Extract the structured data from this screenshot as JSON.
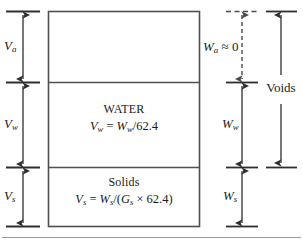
{
  "diagram": {
    "colors": {
      "stroke": "#3a3a3a",
      "text": "#1a1a1a",
      "background": "#ffffff",
      "baseline": "#8a8a8a"
    },
    "volume_side": {
      "items": [
        {
          "id": "air",
          "symbol": "V",
          "subscript": "a"
        },
        {
          "id": "water",
          "symbol": "V",
          "subscript": "w"
        },
        {
          "id": "solids",
          "symbol": "V",
          "subscript": "s"
        }
      ]
    },
    "box": {
      "segments": [
        {
          "id": "air",
          "name": "",
          "formula_lhs": "",
          "formula_rhs": ""
        },
        {
          "id": "water",
          "name": "WATER",
          "formula": "Vw = Ww/62.4"
        },
        {
          "id": "solids",
          "name": "Solids",
          "formula": "Vs = Ws/(Gs x 62.4)"
        }
      ],
      "water_name": "WATER",
      "water_formula": {
        "lhs_symbol": "V",
        "lhs_sub": "w",
        "eq": " = ",
        "rhs_symbol": "W",
        "rhs_sub": "w",
        "tail": "/62.4"
      },
      "solids_name": "Solids",
      "solids_formula": {
        "lhs_symbol": "V",
        "lhs_sub": "s",
        "eq": " = ",
        "rhs_symbol": "W",
        "rhs_sub": "s",
        "mid": "/(",
        "g_symbol": "G",
        "g_sub": "s",
        "times": " × 62.4)"
      }
    },
    "weight_side": {
      "air": {
        "symbol": "W",
        "subscript": "a",
        "relation": " ≈ 0",
        "full": "Wa ≈ 0"
      },
      "water": {
        "symbol": "W",
        "subscript": "w"
      },
      "solids": {
        "symbol": "W",
        "subscript": "s"
      }
    },
    "voids": {
      "label": "Voids"
    }
  }
}
